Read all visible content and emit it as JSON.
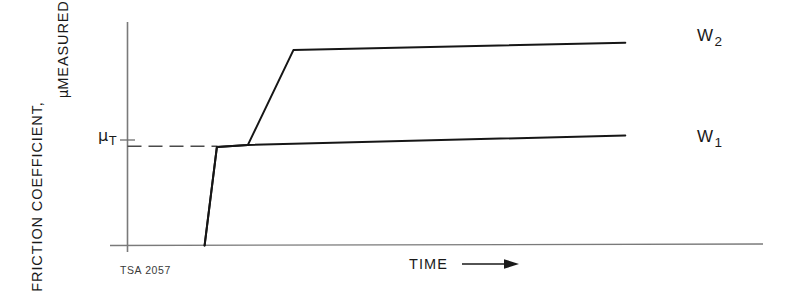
{
  "figure": {
    "number": "TSA 2057",
    "background_color": "#ffffff",
    "ink_color": "#1a1a1a",
    "axis_color": "#6e6e6e"
  },
  "axes": {
    "y_title_line1": "FRICTION COEFFICIENT,",
    "y_title_line2_prefix": "μ",
    "y_title_line2": "MEASURED",
    "x_title": "TIME",
    "x_arrow_icon": "right-arrow-icon",
    "y_tick_label_symbol": "μ",
    "y_tick_label_subscript": "T"
  },
  "series_labels": {
    "upper_symbol": "W",
    "upper_subscript": "2",
    "lower_symbol": "W",
    "lower_subscript": "1"
  },
  "chart_data": {
    "type": "line",
    "title": "",
    "subtitle": "",
    "xlabel": "TIME",
    "ylabel": "FRICTION COEFFICIENT, μMEASURED",
    "xlim": [
      0,
      100
    ],
    "ylim": [
      0,
      100
    ],
    "grid": false,
    "axis_ticks_numeric": false,
    "legend_position": "right-of-curve-ends",
    "annotations": [
      {
        "name": "mu-t-reference-line",
        "type": "horizontal-dashed-line",
        "y": 46.5,
        "x_start": 0,
        "x_end": 16.0,
        "label": "μT",
        "description": "Dashed reference line marking the threshold friction coefficient μT"
      },
      {
        "name": "mu-t-axis-tick",
        "type": "tick",
        "y": 46.5,
        "x": 0
      }
    ],
    "series": [
      {
        "name": "W1",
        "label": "W₁",
        "description": "Lower load: friction rises steeply to μT then increases only slightly with time",
        "x": [
          13.7,
          15.9,
          21.4,
          88.5
        ],
        "y": [
          0.0,
          46.2,
          47.1,
          51.5
        ]
      },
      {
        "name": "W2",
        "label": "W₂",
        "description": "Higher load: after reaching μT the friction rises sharply to a much higher plateau",
        "x": [
          13.7,
          15.9,
          21.4,
          29.5,
          88.5
        ],
        "y": [
          0.0,
          46.2,
          47.1,
          91.5,
          95.0
        ]
      }
    ]
  }
}
